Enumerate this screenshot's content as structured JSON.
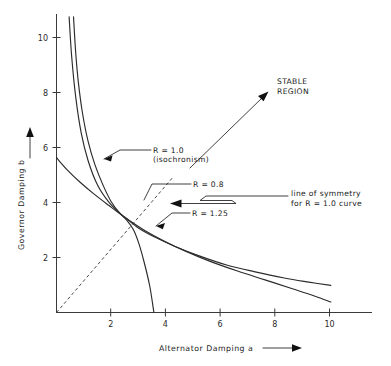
{
  "chart_data": {
    "type": "line",
    "title": "",
    "xlabel": "Alternator Damping a",
    "ylabel": "Governor Damping b",
    "xlim": [
      0,
      11.5
    ],
    "ylim": [
      0,
      10.8
    ],
    "grid": false,
    "legend_position": "inline-annotations",
    "xticks": [
      2,
      4,
      6,
      8,
      10
    ],
    "yticks": [
      2,
      4,
      6,
      8,
      10
    ],
    "xtick_labels": [
      "2",
      "4",
      "6",
      "8",
      "10"
    ],
    "ytick_labels": [
      "2",
      "4",
      "6",
      "8",
      "10"
    ],
    "series": [
      {
        "name": "R = 1.0 (isochronism)",
        "style": "solid",
        "note": "steep curve descending from top-left, crosses x-axis near a = 3.55",
        "points": [
          [
            0.62,
            10.7
          ],
          [
            0.7,
            9.4
          ],
          [
            0.8,
            8.3
          ],
          [
            0.95,
            7.2
          ],
          [
            1.15,
            6.2
          ],
          [
            1.4,
            5.35
          ],
          [
            1.7,
            4.6
          ],
          [
            2.0,
            4.0
          ],
          [
            2.3,
            3.6
          ],
          [
            2.55,
            3.35
          ],
          [
            2.8,
            3.0
          ],
          [
            3.0,
            2.5
          ],
          [
            3.2,
            1.8
          ],
          [
            3.4,
            0.95
          ],
          [
            3.55,
            0.0
          ]
        ]
      },
      {
        "name": "R = 0.8",
        "style": "solid",
        "note": "hyperbola-like upper curve, ends at a = 10, b = 1.0",
        "points": [
          [
            0.46,
            10.7
          ],
          [
            0.55,
            9.3
          ],
          [
            0.7,
            7.8
          ],
          [
            0.9,
            6.5
          ],
          [
            1.15,
            5.5
          ],
          [
            1.5,
            4.6
          ],
          [
            1.9,
            4.0
          ],
          [
            2.3,
            3.6
          ],
          [
            2.55,
            3.4
          ],
          [
            3.0,
            3.05
          ],
          [
            3.6,
            2.72
          ],
          [
            4.3,
            2.4
          ],
          [
            5.2,
            2.05
          ],
          [
            6.2,
            1.72
          ],
          [
            7.2,
            1.48
          ],
          [
            8.3,
            1.25
          ],
          [
            9.2,
            1.1
          ],
          [
            10.0,
            0.98
          ]
        ]
      },
      {
        "name": "R = 1.25",
        "style": "solid",
        "note": "lower shallow curve starting on the b-axis near b = 5.6, ends at a = 10, b = 0.35",
        "points": [
          [
            0.0,
            5.6
          ],
          [
            0.4,
            5.15
          ],
          [
            0.85,
            4.72
          ],
          [
            1.35,
            4.3
          ],
          [
            1.9,
            3.88
          ],
          [
            2.55,
            3.4
          ],
          [
            3.2,
            2.98
          ],
          [
            3.9,
            2.6
          ],
          [
            4.7,
            2.22
          ],
          [
            5.6,
            1.85
          ],
          [
            6.6,
            1.5
          ],
          [
            7.6,
            1.18
          ],
          [
            8.6,
            0.86
          ],
          [
            9.4,
            0.6
          ],
          [
            10.0,
            0.38
          ]
        ]
      }
    ],
    "reference_lines": [
      {
        "name": "line of symmetry for R = 1.0 curve",
        "style": "dashed",
        "from": [
          0,
          0
        ],
        "to": [
          4.25,
          4.9
        ]
      }
    ],
    "annotations": [
      {
        "id": "r-10",
        "text_line_1": "R = 1.0",
        "text_line_2": "(isochronism)",
        "points_to": "R = 1.0 curve"
      },
      {
        "id": "r-08",
        "text_line_1": "R = 0.8",
        "text_line_2": "",
        "points_to": "R = 0.8 curve"
      },
      {
        "id": "r-125",
        "text_line_1": "R = 1.25",
        "text_line_2": "",
        "points_to": "R = 1.25 curve"
      },
      {
        "id": "symmetry",
        "text_line_1": "line of symmetry",
        "text_line_2": "for R = 1.0 curve",
        "points_to": "dashed symmetry line"
      },
      {
        "id": "stable",
        "text_line_1": "STABLE",
        "text_line_2": "REGION",
        "points_to": "upper right area above the curves"
      }
    ]
  },
  "colors": {
    "background": "#ffffff",
    "curve": "#2b2b2b",
    "axis": "#3a3a3a",
    "text": "#1a1a1a",
    "dashed": "#4a4a4a"
  }
}
